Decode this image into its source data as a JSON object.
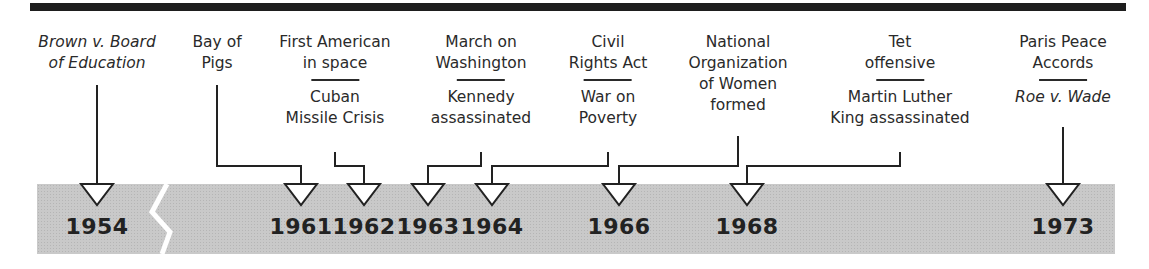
{
  "timeline": {
    "years": [
      {
        "label": "1954",
        "x": 97
      },
      {
        "label": "1961",
        "x": 301
      },
      {
        "label": "1962",
        "x": 364
      },
      {
        "label": "1963",
        "x": 428
      },
      {
        "label": "1964",
        "x": 492
      },
      {
        "label": "1966",
        "x": 619
      },
      {
        "label": "1968",
        "x": 747
      },
      {
        "label": "1973",
        "x": 1063
      }
    ],
    "events": [
      {
        "top": "Brown v. Board",
        "top2": "of Education",
        "italic": true,
        "year": "1954"
      },
      {
        "top": "Bay of",
        "top2": "Pigs",
        "year": "1961"
      },
      {
        "top": "First American",
        "top2": "in space",
        "bottom": "Cuban",
        "bottom2": "Missile Crisis",
        "year_top": "1961",
        "year_bottom": "1962"
      },
      {
        "top": "March on",
        "top2": "Washington",
        "bottom": "Kennedy",
        "bottom2": "assassinated",
        "year_top": "1963",
        "year_bottom": "1963"
      },
      {
        "top": "Civil",
        "top2": "Rights Act",
        "bottom": "War on",
        "bottom2": "Poverty",
        "year": "1964"
      },
      {
        "top": "National",
        "top2": "Organization",
        "top3": "of Women",
        "top4": "formed",
        "year": "1966"
      },
      {
        "top": "Tet",
        "top2": "offensive",
        "bottom": "Martin Luther",
        "bottom2": "King assassinated",
        "year": "1968"
      },
      {
        "top": "Paris Peace",
        "top2": "Accords",
        "bottom": "Roe v. Wade",
        "bottom_italic": true,
        "year": "1973"
      }
    ],
    "break_marker": "axis-break between 1954 and 1961",
    "colors": {
      "band": "#c9c9c9",
      "ink": "#222222",
      "topbar": "#1e1e1e"
    }
  }
}
